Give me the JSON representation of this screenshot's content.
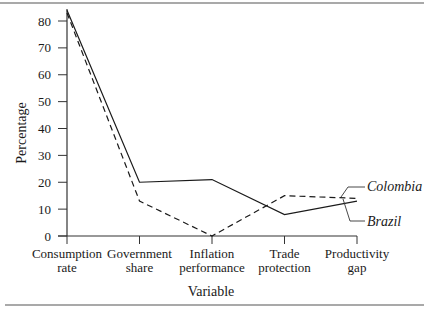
{
  "chart_data": {
    "type": "line",
    "title": "",
    "xlabel": "Variable",
    "ylabel": "Percentage",
    "ylim": [
      0,
      80
    ],
    "yticks": [
      0,
      10,
      20,
      30,
      40,
      50,
      60,
      70,
      80
    ],
    "grid": false,
    "categories": [
      [
        "Consumption",
        "rate"
      ],
      [
        "Government",
        "share"
      ],
      [
        "Inflation",
        "performance"
      ],
      [
        "Trade",
        "protection"
      ],
      [
        "Productivity",
        "gap"
      ]
    ],
    "series": [
      {
        "name": "Brazil",
        "style": "solid",
        "values": [
          84,
          20,
          21,
          8,
          13
        ]
      },
      {
        "name": "Colombia",
        "style": "dashed",
        "values": [
          83,
          13,
          0,
          15,
          14
        ]
      }
    ],
    "legend_position": "right, inline labels with leader lines",
    "colors": {
      "line": "#1a1a1a",
      "axis": "#333333",
      "rule": "#555555"
    }
  }
}
